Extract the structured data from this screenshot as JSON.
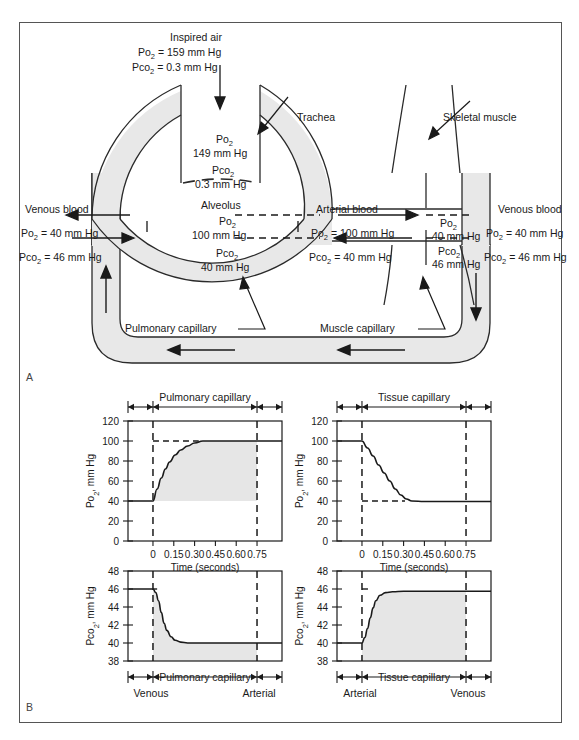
{
  "figure": {
    "panel_a_label": "A",
    "panel_b_label": "B"
  },
  "panel_a": {
    "inspired_air": {
      "title": "Inspired air",
      "po2": "Po",
      "po2_sub": "2",
      "po2_val": "= 159 mm Hg",
      "pco2": "Pco",
      "pco2_sub": "2",
      "pco2_val": "= 0.3 mm Hg"
    },
    "trachea_label": "Trachea",
    "skeletal_muscle_label": "Skeletal muscle",
    "alveolus_label": "Alveolus",
    "trachea_gas": {
      "po2": "Po",
      "po2_sub": "2",
      "po2_val": "149 mm Hg",
      "pco2": "Pco",
      "pco2_sub": "2",
      "pco2_val": "0.3 mm Hg"
    },
    "alveolar_gas": {
      "po2": "Po",
      "po2_sub": "2",
      "po2_val": "100 mm Hg",
      "pco2": "Pco",
      "pco2_sub": "2",
      "pco2_val": "40 mm Hg"
    },
    "venous_blood_left": {
      "label": "Venous blood",
      "po2": "Po",
      "po2_sub": "2",
      "po2_val": "= 40 mm Hg",
      "pco2": "Pco",
      "pco2_sub": "2",
      "pco2_val": "= 46 mm Hg"
    },
    "arterial_blood": {
      "label": "Arterial blood",
      "po2": "Po",
      "po2_sub": "2",
      "po2_val": "= 100 mm Hg",
      "pco2": "Pco",
      "pco2_sub": "2",
      "pco2_val": "= 40 mm Hg"
    },
    "muscle_arterial_side": {
      "po2": "Po",
      "po2_sub": "2",
      "po2_val": "40 mm Hg",
      "pco2": "Pco",
      "pco2_sub": "2",
      "pco2_val": "46 mm Hg"
    },
    "venous_blood_right": {
      "label": "Venous blood",
      "po2": "Po",
      "po2_sub": "2",
      "po2_val": "= 40 mm Hg",
      "pco2": "Pco",
      "pco2_sub": "2",
      "pco2_val": "= 46 mm Hg"
    },
    "pulmonary_capillary_label": "Pulmonary capillary",
    "muscle_capillary_label": "Muscle capillary"
  },
  "chart_data": [
    {
      "id": "pulmonary-po2",
      "type": "line",
      "title": "Pulmonary capillary",
      "left_end_label": "Venous",
      "right_end_label": "Arterial",
      "xlabel": "Time (seconds)",
      "ylabel": "Po2, mm Hg",
      "ylabel_main": "Po",
      "ylabel_sub": "2",
      "ylabel_rest": ", mm Hg",
      "x_ticks": [
        "0",
        "0.15",
        "0.30",
        "0.45",
        "0.60",
        "0.75"
      ],
      "x_values": [
        0,
        0.15,
        0.3,
        0.45,
        0.6,
        0.75
      ],
      "y_ticks": [
        "0",
        "20",
        "40",
        "60",
        "80",
        "100",
        "120"
      ],
      "ylim": [
        0,
        120
      ],
      "xlim": [
        -0.18,
        0.93
      ],
      "reference_lines": [
        100,
        40
      ],
      "x": [
        -0.18,
        0.0,
        0.03,
        0.06,
        0.09,
        0.12,
        0.16,
        0.2,
        0.25,
        0.3,
        0.36,
        0.45,
        0.6,
        0.75,
        0.93
      ],
      "y": [
        40,
        40,
        52,
        63,
        72,
        79,
        86,
        91,
        95,
        98,
        100,
        100,
        100,
        100,
        100
      ]
    },
    {
      "id": "pulmonary-pco2",
      "type": "line",
      "title": "Pulmonary capillary",
      "left_end_label": "Venous",
      "right_end_label": "Arterial",
      "ylabel_main": "Pco",
      "ylabel_sub": "2",
      "ylabel_rest": ", mm Hg",
      "y_ticks": [
        "38",
        "40",
        "42",
        "44",
        "46",
        "48"
      ],
      "ylim": [
        38,
        48
      ],
      "xlim": [
        -0.18,
        0.93
      ],
      "reference_lines": [
        46,
        40
      ],
      "x": [
        -0.18,
        0.0,
        0.02,
        0.04,
        0.06,
        0.08,
        0.1,
        0.13,
        0.16,
        0.2,
        0.25,
        0.35,
        0.5,
        0.75,
        0.93
      ],
      "y": [
        46,
        46,
        45.6,
        44.7,
        43.4,
        42.2,
        41.4,
        40.7,
        40.3,
        40.1,
        40.0,
        40.0,
        40.0,
        40.0,
        40.0
      ]
    },
    {
      "id": "tissue-po2",
      "type": "line",
      "title": "Tissue capillary",
      "left_end_label": "Arterial",
      "right_end_label": "Venous",
      "xlabel": "Time (seconds)",
      "ylabel_main": "Po",
      "ylabel_sub": "2",
      "ylabel_rest": ", mm Hg",
      "x_ticks": [
        "0",
        "0.15",
        "0.30",
        "0.45",
        "0.60",
        "0.75"
      ],
      "y_ticks": [
        "0",
        "20",
        "40",
        "60",
        "80",
        "100",
        "120"
      ],
      "ylim": [
        0,
        120
      ],
      "xlim": [
        -0.18,
        0.93
      ],
      "reference_lines": [
        100,
        40
      ],
      "x": [
        -0.18,
        0.0,
        0.04,
        0.08,
        0.12,
        0.16,
        0.2,
        0.24,
        0.28,
        0.32,
        0.36,
        0.45,
        0.6,
        0.75,
        0.93
      ],
      "y": [
        100,
        100,
        93,
        85,
        76,
        68,
        60,
        52,
        46,
        42,
        40,
        39.5,
        39.5,
        39.5,
        39.5
      ]
    },
    {
      "id": "tissue-pco2",
      "type": "line",
      "title": "Tissue capillary",
      "left_end_label": "Arterial",
      "right_end_label": "Venous",
      "ylabel_main": "Pco",
      "ylabel_sub": "2",
      "ylabel_rest": ", mm Hg",
      "y_ticks": [
        "38",
        "40",
        "42",
        "44",
        "46",
        "48"
      ],
      "ylim": [
        38,
        48
      ],
      "xlim": [
        -0.18,
        0.93
      ],
      "reference_lines": [
        46,
        40
      ],
      "x": [
        -0.18,
        0.0,
        0.02,
        0.04,
        0.06,
        0.08,
        0.1,
        0.13,
        0.17,
        0.22,
        0.3,
        0.45,
        0.6,
        0.75,
        0.93
      ],
      "y": [
        40,
        40,
        40.6,
        41.6,
        42.8,
        43.9,
        44.7,
        45.3,
        45.6,
        45.7,
        45.75,
        45.75,
        45.75,
        45.75,
        45.75
      ]
    }
  ],
  "colors": {
    "shade": "#e6e6e6",
    "line": "#1a1a1a",
    "frame": "#555555"
  }
}
